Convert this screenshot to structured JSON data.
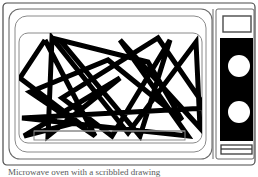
{
  "figure": {
    "caption": "Microwave oven with a scribbled drawing",
    "background_color": "#ffffff",
    "line_color": "#000000",
    "outline_color": "#4a4a4a",
    "panel_strip_color": "#000000",
    "knob_color": "#ffffff"
  },
  "body": {
    "outer_case_name": "outer-case",
    "door_panel_name": "door-panel"
  },
  "door": {
    "frame_label": "door-frame",
    "window_label": "door-window",
    "tray_label": "oven-tray-bar",
    "handle_label": "door-handle"
  },
  "control_panel": {
    "display_label": "display-window",
    "strip_label": "control-strip",
    "knobs": [
      {
        "name": "timer-knob",
        "cx": 239,
        "cy": 66,
        "r": 11
      },
      {
        "name": "power-knob",
        "cx": 239,
        "cy": 112,
        "r": 11
      }
    ],
    "bottom_slot_label": "vent-slot"
  },
  "chart_data": {
    "type": "line",
    "xlabel": "",
    "ylabel": "",
    "xlim": [
      18,
      206
    ],
    "ylim": [
      36,
      140
    ],
    "grid": false,
    "legend": "none",
    "stroke_width": 5,
    "series": [
      {
        "name": "scribble-path-1",
        "points": [
          [
            45,
            40
          ],
          [
            20,
            78
          ],
          [
            78,
            122
          ],
          [
            24,
            136
          ],
          [
            120,
            78
          ],
          [
            48,
            136
          ],
          [
            52,
            38
          ],
          [
            128,
            133
          ],
          [
            196,
            42
          ],
          [
            200,
            128
          ],
          [
            120,
            40
          ],
          [
            188,
            136
          ],
          [
            22,
            118
          ],
          [
            206,
            108
          ],
          [
            158,
            38
          ],
          [
            62,
            98
          ],
          [
            112,
            136
          ],
          [
            170,
            40
          ],
          [
            140,
            136
          ],
          [
            60,
            40
          ],
          [
            148,
            62
          ],
          [
            182,
            120
          ],
          [
            108,
            60
          ],
          [
            30,
            92
          ],
          [
            95,
            136
          ],
          [
            45,
            40
          ]
        ]
      }
    ]
  }
}
